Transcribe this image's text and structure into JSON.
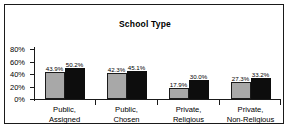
{
  "chart_data": {
    "type": "bar",
    "title": "School Type",
    "xlabel": "",
    "ylabel": "",
    "ylim": [
      0,
      80
    ],
    "ytick_labels": [
      "80%",
      "60%",
      "40%",
      "20%",
      "0%"
    ],
    "ytick_values": [
      80,
      60,
      40,
      20,
      0
    ],
    "grid": false,
    "legend": "none",
    "categories": [
      "Public,\nAssigned",
      "Public,\nChosen",
      "Private,\nReligious",
      "Private,\nNon-Religious"
    ],
    "category_lines": [
      [
        "Public,",
        "Assigned"
      ],
      [
        "Public,",
        "Chosen"
      ],
      [
        "Private,",
        "Religious"
      ],
      [
        "Private,",
        "Non-Religious"
      ]
    ],
    "series": [
      {
        "name": "series-gray",
        "color": "#a8a8a8",
        "values": [
          43.9,
          42.3,
          17.9,
          27.3
        ],
        "labels": [
          "43.9%",
          "42.3%",
          "17.9%",
          "27.3%"
        ]
      },
      {
        "name": "series-black",
        "color": "#0d0d0d",
        "values": [
          50.2,
          45.1,
          30.0,
          33.2
        ],
        "labels": [
          "50.2%",
          "45.1%",
          "30.0%",
          "33.2%"
        ]
      }
    ]
  }
}
